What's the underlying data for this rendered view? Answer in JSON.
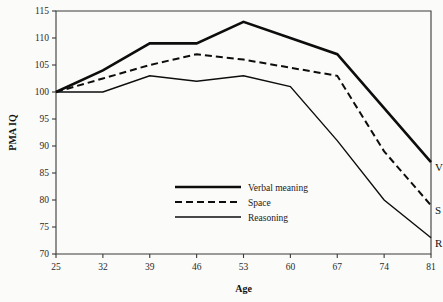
{
  "chart_data": {
    "type": "line",
    "title": "",
    "subtitle": "",
    "xlabel": "Age",
    "ylabel": "PMA IQ",
    "x": [
      25,
      32,
      39,
      46,
      53,
      60,
      67,
      74,
      81
    ],
    "xtick_labels": [
      "25",
      "32",
      "39",
      "46",
      "53",
      "60",
      "67",
      "74",
      "81"
    ],
    "ytick_labels": [
      "70",
      "75",
      "80",
      "85",
      "90",
      "95",
      "100",
      "105",
      "110",
      "115"
    ],
    "yticks": [
      70,
      75,
      80,
      85,
      90,
      95,
      100,
      105,
      110,
      115
    ],
    "xlim": [
      25,
      81
    ],
    "ylim": [
      70,
      115
    ],
    "grid": false,
    "legend_position": "center-bottom-inside",
    "series": [
      {
        "name": "Verbal meaning",
        "short_label": "V",
        "style": "thick-solid",
        "values": [
          100,
          104,
          109,
          109,
          113,
          110,
          107,
          97,
          87
        ]
      },
      {
        "name": "Space",
        "short_label": "S",
        "style": "dashed",
        "values": [
          100,
          102.5,
          105,
          107,
          106,
          104.5,
          103,
          89,
          79
        ]
      },
      {
        "name": "Reasoning",
        "short_label": "R",
        "style": "thin-solid",
        "values": [
          100,
          100,
          103,
          102,
          103,
          101,
          91,
          80,
          73
        ]
      }
    ],
    "annotations": [
      {
        "text": "V",
        "x": 81,
        "y": 87
      },
      {
        "text": "S",
        "x": 81,
        "y": 79
      },
      {
        "text": "R",
        "x": 81,
        "y": 73
      }
    ]
  },
  "legend": {
    "entries": [
      {
        "label": "Verbal meaning",
        "style": "thick-solid"
      },
      {
        "label": "Space",
        "style": "dashed"
      },
      {
        "label": "Reasoning",
        "style": "thin-solid"
      }
    ]
  },
  "colors": {
    "background": "#fbfbf9",
    "ink": "#0d0d0d",
    "axis": "#3a3a3a"
  }
}
